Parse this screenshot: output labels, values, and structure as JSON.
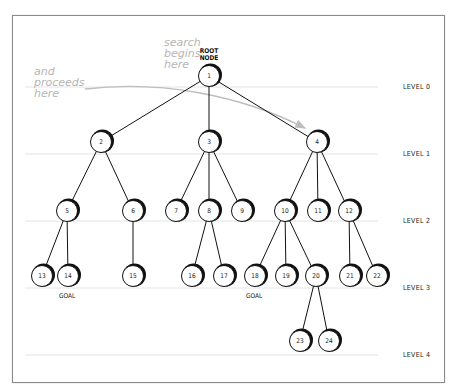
{
  "annotations": {
    "search_begins": [
      "search",
      "begins",
      "here"
    ],
    "proceeds": [
      "and",
      "proceeds",
      "here"
    ],
    "root_label": [
      "ROOT",
      "NODE"
    ],
    "goal_label": "GOAL"
  },
  "levels": [
    {
      "label": "LEVEL 0",
      "y": 87
    },
    {
      "label": "LEVEL 1",
      "y": 154
    },
    {
      "label": "LEVEL 2",
      "y": 221
    },
    {
      "label": "LEVEL 3",
      "y": 288
    },
    {
      "label": "LEVEL 4",
      "y": 355
    }
  ],
  "nodes": [
    {
      "id": "1",
      "x": 209,
      "y": 76,
      "parent": null
    },
    {
      "id": "2",
      "x": 101,
      "y": 142,
      "parent": "1"
    },
    {
      "id": "3",
      "x": 209,
      "y": 142,
      "parent": "1"
    },
    {
      "id": "4",
      "x": 317,
      "y": 142,
      "parent": "1"
    },
    {
      "id": "5",
      "x": 67,
      "y": 211,
      "parent": "2"
    },
    {
      "id": "6",
      "x": 133,
      "y": 211,
      "parent": "2"
    },
    {
      "id": "7",
      "x": 176,
      "y": 211,
      "parent": "3"
    },
    {
      "id": "8",
      "x": 209,
      "y": 211,
      "parent": "3"
    },
    {
      "id": "9",
      "x": 242,
      "y": 211,
      "parent": "3"
    },
    {
      "id": "10",
      "x": 285,
      "y": 211,
      "parent": "4"
    },
    {
      "id": "11",
      "x": 318,
      "y": 211,
      "parent": "4"
    },
    {
      "id": "12",
      "x": 349,
      "y": 211,
      "parent": "4"
    },
    {
      "id": "13",
      "x": 42,
      "y": 276,
      "parent": "5"
    },
    {
      "id": "14",
      "x": 68,
      "y": 276,
      "parent": "5",
      "goal": true
    },
    {
      "id": "15",
      "x": 133,
      "y": 276,
      "parent": "6"
    },
    {
      "id": "16",
      "x": 192,
      "y": 276,
      "parent": "8"
    },
    {
      "id": "17",
      "x": 224,
      "y": 276,
      "parent": "8"
    },
    {
      "id": "18",
      "x": 255,
      "y": 276,
      "parent": "10",
      "goal": true
    },
    {
      "id": "19",
      "x": 286,
      "y": 276,
      "parent": "10"
    },
    {
      "id": "20",
      "x": 316,
      "y": 276,
      "parent": "10"
    },
    {
      "id": "21",
      "x": 350,
      "y": 276,
      "parent": "12"
    },
    {
      "id": "22",
      "x": 377,
      "y": 276,
      "parent": "12"
    },
    {
      "id": "23",
      "x": 300,
      "y": 341,
      "parent": "20"
    },
    {
      "id": "24",
      "x": 329,
      "y": 341,
      "parent": "20"
    }
  ],
  "colors": {
    "edge": "#111111",
    "level_line": "#e4e4e4",
    "arrow": "#bdbdbd",
    "annotation": "#b5b5b5"
  }
}
